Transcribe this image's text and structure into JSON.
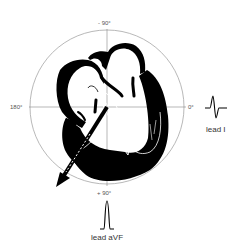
{
  "figure": {
    "type": "hexaxial heart axis diagram",
    "angles": {
      "top": "- 90°",
      "left": "180°",
      "right": "0°",
      "bottom": "+ 90°"
    },
    "leads": {
      "lead_i": {
        "label": "lead I",
        "waveform": "biphasic (up then down)"
      },
      "lead_avf": {
        "label": "lead aVF",
        "waveform": "positive upright"
      }
    },
    "axis_arrow": {
      "direction": "down-left",
      "angle_deg": 135
    },
    "colors": {
      "ink": "#000000",
      "grid": "#888888",
      "text": "#555555"
    }
  }
}
